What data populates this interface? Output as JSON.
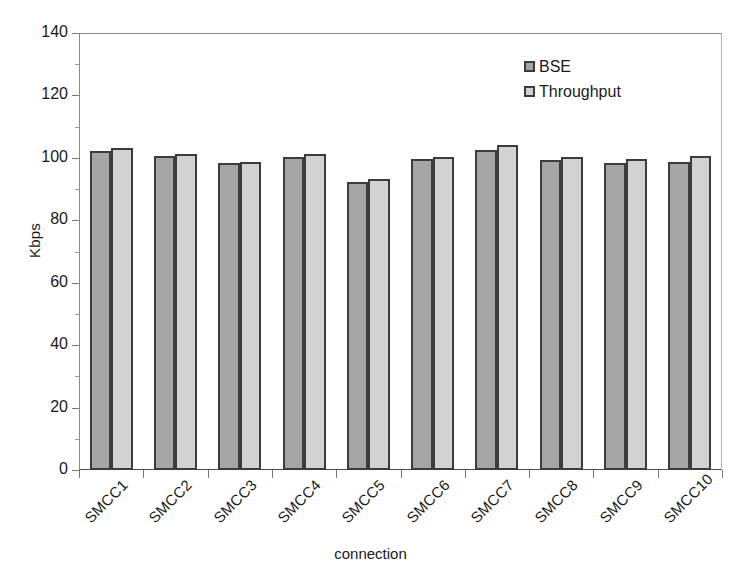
{
  "chart_data": {
    "type": "bar",
    "title": "",
    "xlabel": "connection",
    "ylabel": "Kbps",
    "ylim": [
      0,
      140
    ],
    "ytick_step": 20,
    "yticks": [
      0,
      20,
      40,
      60,
      80,
      100,
      120,
      140
    ],
    "ytick_labels": [
      "0",
      "20",
      "40",
      "60",
      "80",
      "100",
      "120",
      "140"
    ],
    "grid": false,
    "legend_position": "top-right",
    "categories": [
      "SMCC1",
      "SMCC2",
      "SMCC3",
      "SMCC4",
      "SMCC5",
      "SMCC6",
      "SMCC7",
      "SMCC8",
      "SMCC9",
      "SMCC10"
    ],
    "series": [
      {
        "name": "BSE",
        "color": "#a5a5a5",
        "values": [
          102.3,
          100.7,
          98.2,
          100.2,
          92.3,
          99.7,
          102.4,
          99.2,
          98.4,
          98.7
        ]
      },
      {
        "name": "Throughput",
        "color": "#d2d2d2",
        "values": [
          103.1,
          101.2,
          98.8,
          101.3,
          93.1,
          100.3,
          104.0,
          100.2,
          99.6,
          100.7
        ]
      }
    ]
  },
  "legend": {
    "items": [
      {
        "label": "BSE",
        "series_key": "bse"
      },
      {
        "label": "Throughput",
        "series_key": "thr"
      }
    ]
  },
  "axes": {
    "y_title": "Kbps",
    "x_title": "connection"
  }
}
